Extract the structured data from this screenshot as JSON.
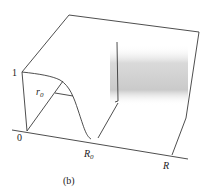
{
  "figure": {
    "caption": "(b)",
    "labels": {
      "one": "1",
      "origin": "0",
      "r0": "r",
      "r0_sub": "0",
      "R0": "R",
      "R0_sub": "0",
      "R": "R"
    },
    "colors": {
      "line": "#3a3a3a",
      "shade": "#c8c8c8",
      "background": "#ffffff"
    }
  }
}
